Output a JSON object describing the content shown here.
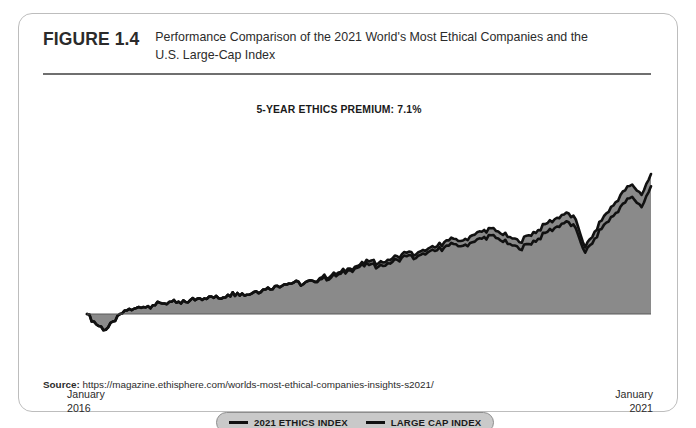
{
  "figure": {
    "number": "FIGURE 1.4",
    "title": "Performance Comparison of the 2021 World's Most Ethical Companies and the U.S. Large-Cap Index"
  },
  "source": {
    "label": "Source:",
    "url": "https://magazine.ethisphere.com/worlds-most-ethical-companies-insights-s2021/"
  },
  "legend": {
    "items": [
      {
        "label": "2021 ETHICS INDEX",
        "color": "#111111"
      },
      {
        "label": "LARGE CAP INDEX",
        "color": "#111111"
      }
    ]
  },
  "colors": {
    "line": "#111111",
    "area_fill": "#8a8a8a",
    "card_border": "#bdbdbd",
    "rule": "#6f6f6f",
    "legend_background": "#c9c9c9"
  },
  "chart_data": {
    "type": "line",
    "title": "5-YEAR ETHICS PREMIUM: 7.1%",
    "annotation": "5-YEAR ETHICS PREMIUM: 7.1%",
    "xlabel": "",
    "ylabel": "",
    "grid": false,
    "legend_position": "bottom-center",
    "axis_ticks": [
      {
        "position": "left",
        "line1": "January",
        "line2": "2016"
      },
      {
        "position": "right",
        "line1": "January",
        "line2": "2021"
      }
    ],
    "xlim": [
      0,
      60
    ],
    "ylim": [
      -8,
      112
    ],
    "x_unit": "months since January 2016",
    "series": [
      {
        "name": "2021 ETHICS INDEX",
        "color": "#111111",
        "x": [
          0,
          1,
          2,
          3,
          4,
          5,
          6,
          7,
          8,
          9,
          10,
          11,
          12,
          13,
          14,
          15,
          16,
          17,
          18,
          19,
          20,
          21,
          22,
          23,
          24,
          25,
          26,
          27,
          28,
          29,
          30,
          31,
          32,
          33,
          34,
          35,
          36,
          37,
          38,
          39,
          40,
          41,
          42,
          43,
          44,
          45,
          46,
          47,
          48,
          49,
          50,
          51,
          52,
          53,
          54,
          55,
          56,
          57,
          58,
          59,
          60
        ],
        "values": [
          0,
          -6,
          -9,
          -4,
          2,
          3,
          4,
          5,
          6,
          7,
          6,
          8,
          9,
          10,
          9,
          11,
          12,
          11,
          13,
          14,
          16,
          17,
          18,
          17,
          19,
          21,
          22,
          24,
          26,
          28,
          30,
          29,
          31,
          33,
          35,
          34,
          36,
          38,
          41,
          43,
          42,
          45,
          47,
          49,
          46,
          44,
          41,
          45,
          48,
          52,
          55,
          58,
          54,
          38,
          47,
          56,
          62,
          70,
          74,
          68,
          80
        ]
      },
      {
        "name": "LARGE CAP INDEX",
        "color": "#111111",
        "x": [
          0,
          1,
          2,
          3,
          4,
          5,
          6,
          7,
          8,
          9,
          10,
          11,
          12,
          13,
          14,
          15,
          16,
          17,
          18,
          19,
          20,
          21,
          22,
          23,
          24,
          25,
          26,
          27,
          28,
          29,
          30,
          31,
          32,
          33,
          34,
          35,
          36,
          37,
          38,
          39,
          40,
          41,
          42,
          43,
          44,
          45,
          46,
          47,
          48,
          49,
          50,
          51,
          52,
          53,
          54,
          55,
          56,
          57,
          58,
          59,
          60
        ],
        "values": [
          0,
          -6,
          -9,
          -4,
          2,
          3,
          4,
          5,
          6,
          7,
          6,
          8,
          9,
          10,
          9,
          11,
          12,
          11,
          13,
          14,
          16,
          17,
          18,
          17,
          19,
          20,
          21,
          23,
          25,
          27,
          28,
          27,
          29,
          31,
          33,
          32,
          34,
          36,
          38,
          40,
          39,
          41,
          43,
          45,
          42,
          40,
          37,
          40,
          43,
          47,
          50,
          53,
          49,
          35,
          43,
          51,
          56,
          63,
          67,
          61,
          73
        ]
      }
    ]
  }
}
